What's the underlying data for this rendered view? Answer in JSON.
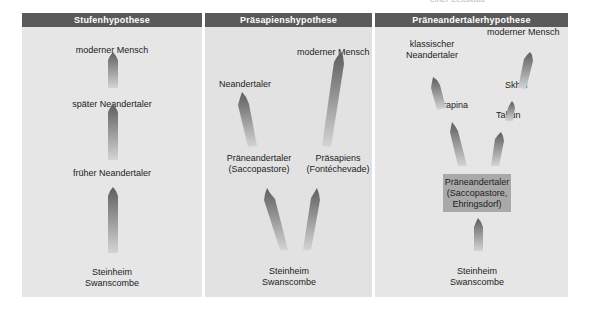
{
  "top_note": "einer Zeitskala",
  "colors": {
    "header_bg": "#5a5a5a",
    "panel_bg": "#e6e6e6",
    "arrow_dark": "#6a6a6a",
    "arrow_light": "#cfcfcf",
    "box_bg": "#a9a9a9"
  },
  "panels": [
    {
      "title": "Stufenhypothese",
      "labels": {
        "modern": "moderner Mensch",
        "late_neanderthal": "später Neandertaler",
        "early_neanderthal": "früher Neandertaler",
        "base_line1": "Steinheim",
        "base_line2": "Swanscombe"
      }
    },
    {
      "title": "Präsapienshypothese",
      "labels": {
        "modern": "moderner Mensch",
        "neanderthal": "Neandertaler",
        "preneanderthal_line1": "Präneandertaler",
        "preneanderthal_line2": "(Saccopastore)",
        "presapiens_line1": "Präsapiens",
        "presapiens_line2": "(Fontéchevade)",
        "base_line1": "Steinheim",
        "base_line2": "Swanscombe"
      }
    },
    {
      "title": "Präneandertalerhypothese",
      "labels": {
        "classic_line1": "klassischer",
        "classic_line2": "Neandertaler",
        "modern": "moderner Mensch",
        "skhul": "Skhul",
        "krapina": "Krapina",
        "tabun": "Tabun",
        "box_line1": "Präneandertaler",
        "box_line2": "(Saccopastore,",
        "box_line3": "Ehringsdorf)",
        "base_line1": "Steinheim",
        "base_line2": "Swanscombe"
      }
    }
  ]
}
